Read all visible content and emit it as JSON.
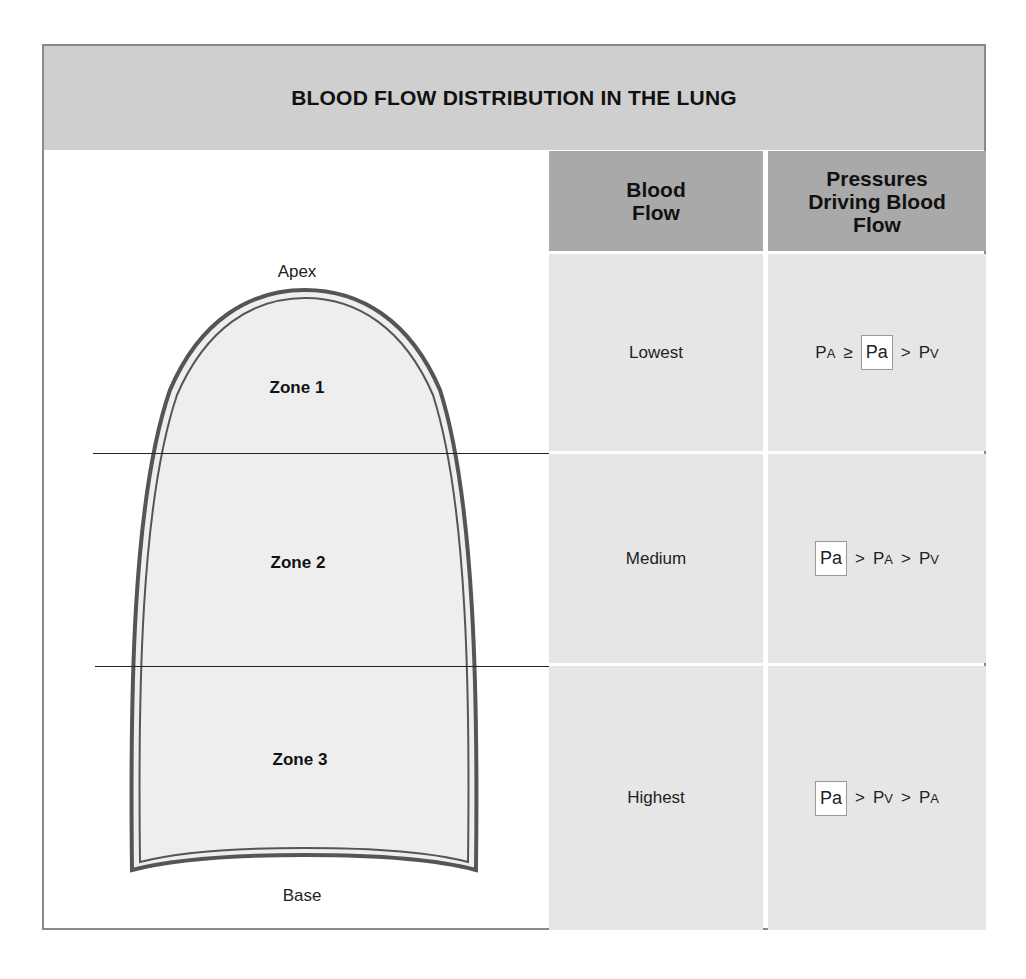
{
  "title": "BLOOD FLOW DISTRIBUTION IN THE LUNG",
  "diagram": {
    "apex_label": "Apex",
    "base_label": "Base",
    "zones": [
      {
        "label": "Zone 1"
      },
      {
        "label": "Zone 2"
      },
      {
        "label": "Zone 3"
      }
    ]
  },
  "table": {
    "headers": {
      "blood_flow": [
        "Blood",
        "Flow"
      ],
      "pressures": [
        "Pressures",
        "Driving Blood",
        "Flow"
      ]
    },
    "rows": [
      {
        "blood_flow": "Lowest",
        "pressure": [
          {
            "t": "P",
            "s": "A"
          },
          {
            "op": "≥"
          },
          {
            "t": "Pa",
            "boxed": true
          },
          {
            "op": ">"
          },
          {
            "t": "P",
            "s": "V"
          }
        ]
      },
      {
        "blood_flow": "Medium",
        "pressure": [
          {
            "t": "Pa",
            "boxed": true
          },
          {
            "op": ">"
          },
          {
            "t": "P",
            "s": "A"
          },
          {
            "op": ">"
          },
          {
            "t": "P",
            "s": "V"
          }
        ]
      },
      {
        "blood_flow": "Highest",
        "pressure": [
          {
            "t": "Pa",
            "boxed": true
          },
          {
            "op": ">"
          },
          {
            "t": "P",
            "s": "V"
          },
          {
            "op": ">"
          },
          {
            "t": "P",
            "s": "A"
          }
        ]
      }
    ]
  },
  "colors": {
    "title_band": "#cfcfcf",
    "header_cell": "#a9a9a9",
    "body_cell": "#e6e6e6",
    "lung_fill": "#eeeeee",
    "lung_outline": "#555555"
  }
}
